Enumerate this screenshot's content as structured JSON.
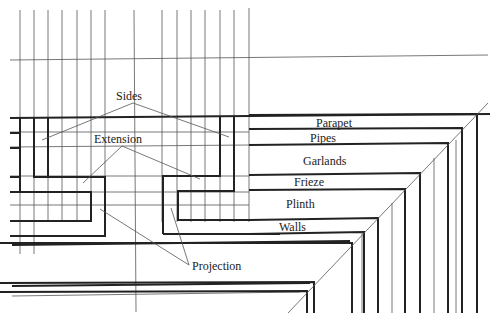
{
  "diagram": {
    "title": "",
    "labels": {
      "sides": "Sides",
      "extension": "Extension",
      "projection": "Projection",
      "parapet": "Parapet",
      "pipes": "Pipes",
      "garlands": "Garlands",
      "frieze": "Frieze",
      "plinth": "Plinth",
      "walls": "Walls"
    },
    "colors": {
      "line": "#222222",
      "thin_line": "#555555",
      "background": "#ffffff"
    }
  }
}
